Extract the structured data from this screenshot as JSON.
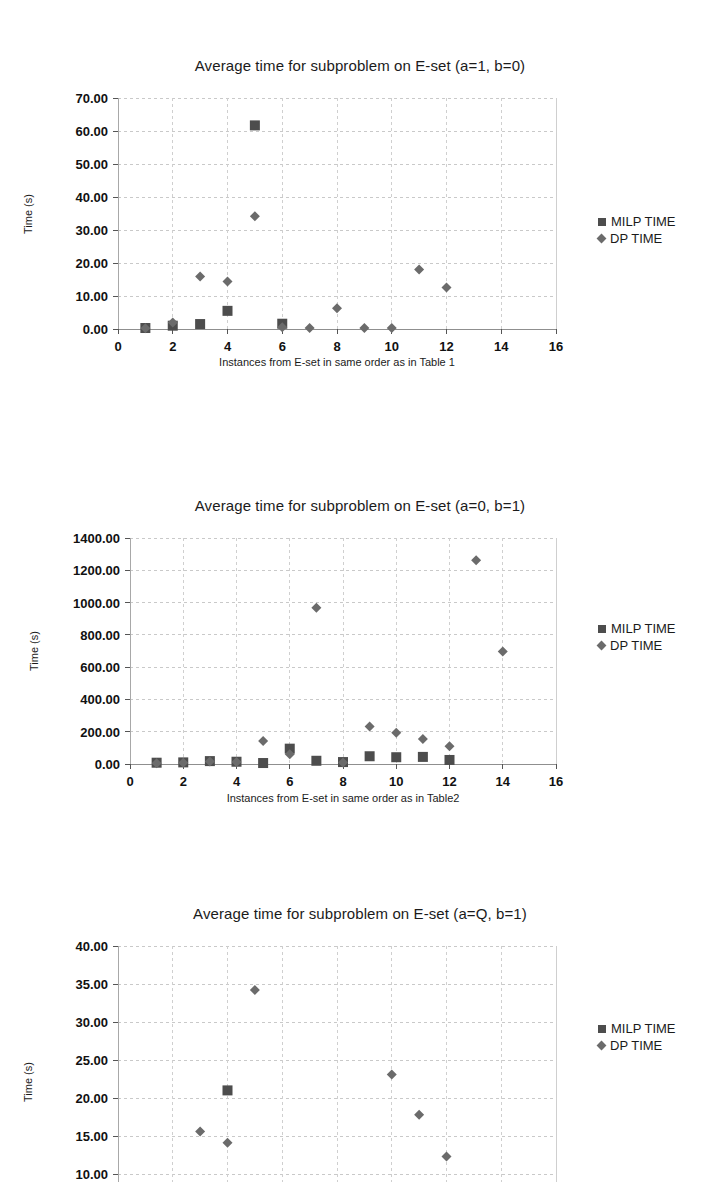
{
  "page": {
    "background": "#ffffff",
    "series_colors": {
      "milp": "#4d4d4d",
      "dp": "#6b6b6b"
    }
  },
  "legend": {
    "milp_label": "MILP TIME",
    "dp_label": "DP TIME",
    "milp_marker": "square-marker-icon",
    "dp_marker": "diamond-marker-icon"
  },
  "charts": [
    {
      "id": "chart-a1-b0",
      "title": "Average time for subproblem on E-set (a=1, b=0)"
    },
    {
      "id": "chart-a0-b1",
      "title": "Average time for subproblem on E-set (a=0, b=1)"
    },
    {
      "id": "chart-aQ-b1",
      "title": "Average time for subproblem on E-set (a=Q, b=1)"
    }
  ],
  "chart_data": [
    {
      "type": "scatter",
      "title": "Average time for subproblem on E-set (a=1, b=0)",
      "xlabel": "Instances from E-set in same order as in Table 1",
      "ylabel": "Time (s)",
      "xlim": [
        0,
        16
      ],
      "ylim": [
        0,
        70
      ],
      "xticks": [
        0,
        2,
        4,
        6,
        8,
        10,
        12,
        14,
        16
      ],
      "yticks": [
        0,
        10,
        20,
        30,
        40,
        50,
        60,
        70
      ],
      "ytick_labels": [
        "0.00",
        "10.00",
        "20.00",
        "30.00",
        "40.00",
        "50.00",
        "60.00",
        "70.00"
      ],
      "xtick_labels": [
        "0",
        "2",
        "4",
        "6",
        "8",
        "10",
        "12",
        "14",
        "16"
      ],
      "grid": true,
      "legend_position": "right",
      "series": [
        {
          "name": "MILP TIME",
          "marker": "square",
          "color": "#4d4d4d",
          "x": [
            1,
            2,
            3,
            4,
            5,
            6
          ],
          "y": [
            0.3,
            1.0,
            1.5,
            5.5,
            61.7,
            1.6
          ]
        },
        {
          "name": "DP TIME",
          "marker": "diamond",
          "color": "#6b6b6b",
          "x": [
            1,
            2,
            3,
            4,
            5,
            6,
            7,
            8,
            9,
            10,
            11,
            12
          ],
          "y": [
            0.2,
            2.0,
            15.9,
            14.4,
            34.2,
            0.5,
            0.3,
            6.3,
            0.3,
            0.3,
            18.0,
            12.6
          ]
        }
      ]
    },
    {
      "type": "scatter",
      "title": "Average time for subproblem on E-set (a=0, b=1)",
      "xlabel": "Instances from E-set in same order as in Table2",
      "ylabel": "Time (s)",
      "xlim": [
        0,
        16
      ],
      "ylim": [
        0,
        1400
      ],
      "xticks": [
        0,
        2,
        4,
        6,
        8,
        10,
        12,
        14,
        16
      ],
      "yticks": [
        0,
        200,
        400,
        600,
        800,
        1000,
        1200,
        1400
      ],
      "ytick_labels": [
        "0.00",
        "200.00",
        "400.00",
        "600.00",
        "800.00",
        "1000.00",
        "1200.00",
        "1400.00"
      ],
      "xtick_labels": [
        "0",
        "2",
        "4",
        "6",
        "8",
        "10",
        "12",
        "14",
        "16"
      ],
      "grid": true,
      "legend_position": "right",
      "series": [
        {
          "name": "MILP TIME",
          "marker": "square",
          "color": "#4d4d4d",
          "x": [
            1,
            2,
            3,
            4,
            5,
            6,
            7,
            8,
            9,
            10,
            11,
            12
          ],
          "y": [
            8,
            10,
            18,
            14,
            6,
            95,
            20,
            12,
            48,
            42,
            44,
            25
          ]
        },
        {
          "name": "DP TIME",
          "marker": "diamond",
          "color": "#6b6b6b",
          "x": [
            1,
            2,
            3,
            4,
            5,
            6,
            7,
            8,
            9,
            10,
            11,
            12,
            13,
            14
          ],
          "y": [
            5,
            8,
            16,
            12,
            142,
            60,
            968,
            10,
            232,
            194,
            155,
            110,
            1262,
            697
          ]
        }
      ]
    },
    {
      "type": "scatter",
      "title": "Average time for subproblem on E-set (a=Q, b=1)",
      "xlabel": "",
      "ylabel": "Time (s)",
      "xlim": [
        0,
        16
      ],
      "ylim": [
        5,
        40
      ],
      "yticks": [
        5,
        10,
        15,
        20,
        25,
        30,
        35,
        40
      ],
      "ytick_labels": [
        "5.00",
        "10.00",
        "15.00",
        "20.00",
        "25.00",
        "30.00",
        "35.00",
        "40.00"
      ],
      "xticks": [
        0,
        2,
        4,
        6,
        8,
        10,
        12,
        14,
        16
      ],
      "xtick_labels": [
        "0",
        "2",
        "4",
        "6",
        "8",
        "10",
        "12",
        "14",
        "16"
      ],
      "grid": true,
      "clipped_bottom": true,
      "legend_position": "right",
      "series": [
        {
          "name": "MILP TIME",
          "marker": "square",
          "color": "#4d4d4d",
          "x": [
            4
          ],
          "y": [
            21.0
          ]
        },
        {
          "name": "DP TIME",
          "marker": "diamond",
          "color": "#6b6b6b",
          "x": [
            3,
            4,
            5,
            8,
            10,
            11,
            12
          ],
          "y": [
            15.6,
            14.1,
            34.2,
            6.0,
            23.1,
            17.8,
            12.3
          ]
        }
      ]
    }
  ]
}
